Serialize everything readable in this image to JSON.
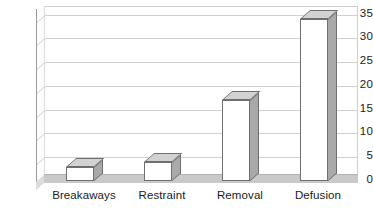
{
  "chart_data": {
    "type": "bar",
    "title": "",
    "subtitle": "",
    "xlabel": "",
    "ylabel": "",
    "categories": [
      "Breakaways",
      "Restraint",
      "Removal",
      "Defusion"
    ],
    "values": [
      3,
      4,
      17,
      34
    ],
    "series": [
      {
        "name": "Incidents",
        "values": [
          3,
          4,
          17,
          34
        ]
      }
    ],
    "ylim": [
      0,
      35
    ],
    "ytick_labels": [
      "0",
      "5",
      "10",
      "15",
      "20",
      "25",
      "30",
      "35"
    ],
    "ytick_values": [
      0,
      5,
      10,
      15,
      20,
      25,
      30,
      35
    ],
    "grid": true,
    "legend": "none",
    "style_3d": true,
    "colors": {
      "bar_front": "#ffffff",
      "bar_side": "#a9a9a9",
      "bar_top": "#d2d2d2",
      "bar_outline": "#6f6f6f",
      "gridline": "#d0d0d0",
      "axis": "#9a9a9a",
      "floor": "#c9c9c9",
      "background": "#ffffff",
      "text": "#1a1a1a"
    }
  }
}
